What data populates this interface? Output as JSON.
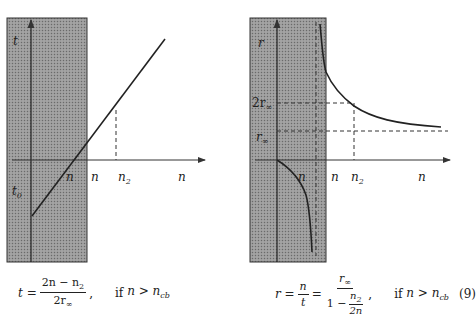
{
  "left_diagram": {
    "y_axis_label": "t",
    "y_intercept_label": "t",
    "y_intercept_sub": "0",
    "x_axis_labels": [
      {
        "text": "n",
        "sub": ""
      },
      {
        "text": "n",
        "sub": ""
      },
      {
        "text": "n",
        "sub": "2"
      },
      {
        "text": "n",
        "sub": ""
      }
    ],
    "shaded_region_color": "#8f8f8f",
    "curve": "straight line t = (2n - n2) / (2r∞)"
  },
  "right_diagram": {
    "y_axis_label": "r",
    "y_tick_labels": [
      {
        "text": "2r",
        "sub": "∞"
      },
      {
        "text": "r",
        "sub": "∞"
      }
    ],
    "x_axis_labels": [
      {
        "text": "n",
        "sub": ""
      },
      {
        "text": "n",
        "sub": ""
      },
      {
        "text": "n",
        "sub": "2"
      },
      {
        "text": "n",
        "sub": ""
      }
    ],
    "shaded_region_color": "#8f8f8f",
    "curve": "hyperbola r = r∞ / (1 - n2/(2n)) with vertical asymptote"
  },
  "equations": {
    "left": {
      "lhs": "t =",
      "num": "2n − n",
      "num_sub": "2",
      "den": "2r",
      "den_sub": "∞",
      "comma": ",",
      "condition_if": "if",
      "condition": "n > n",
      "condition_sub": "cb"
    },
    "right": {
      "lhs": "r =",
      "frac1_num": "n",
      "frac1_den": "t",
      "eq2": "=",
      "frac2_num": "r",
      "frac2_num_sub": "∞",
      "frac2_den_one": "1 −",
      "inner_num": "n",
      "inner_num_sub": "2",
      "inner_den": "2n",
      "comma": ",",
      "condition_if": "if",
      "condition": "n > n",
      "condition_sub": "cb",
      "eq_number": "(9)"
    }
  }
}
